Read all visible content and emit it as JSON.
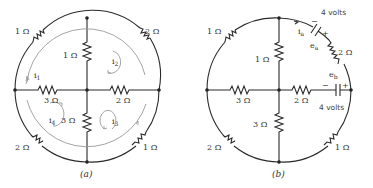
{
  "figure": {
    "panel_a": {
      "caption": "(a)",
      "resistors": {
        "top_left": "1 Ω",
        "top_right": "2 Ω",
        "center_vertical_top": "1 Ω",
        "left_horizontal": "3 Ω",
        "right_horizontal": "2 Ω",
        "center_vertical_bottom": "3 Ω",
        "bottom_left": "2 Ω",
        "bottom_right": "1 Ω"
      },
      "currents": {
        "loop1": "i",
        "loop1_sub": "1",
        "loop2": "i",
        "loop2_sub": "2",
        "loop3": "i",
        "loop3_sub": "3",
        "loop4": "i",
        "loop4_sub": "4"
      }
    },
    "panel_b": {
      "caption": "(b)",
      "resistors": {
        "top_left": "1 Ω",
        "top_right": "2 Ω",
        "center_vertical_top": "1 Ω",
        "left_horizontal": "3 Ω",
        "right_horizontal": "2 Ω",
        "center_vertical_bottom": "3 Ω",
        "bottom_left": "2 Ω",
        "bottom_right": "1 Ω"
      },
      "sources": {
        "ea_value": "4 volts",
        "ea_label": "e",
        "ea_sub": "a",
        "eb_value": "4 volts",
        "eb_label": "e",
        "eb_sub": "b",
        "minus": "−",
        "plus": "+"
      },
      "current": {
        "label": "i",
        "sub": "a"
      }
    }
  }
}
